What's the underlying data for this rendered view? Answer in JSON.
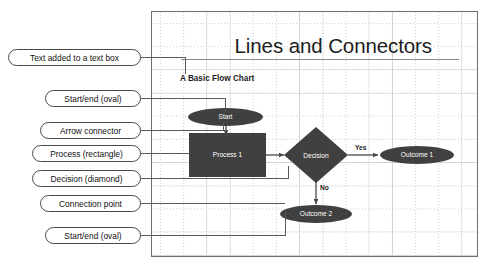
{
  "slide": {
    "title": "Lines and Connectors",
    "subtitle": "A Basic Flow Chart"
  },
  "flowchart": {
    "nodes": [
      {
        "id": "start",
        "label": "Start",
        "shape": "oval"
      },
      {
        "id": "process",
        "label": "Process 1",
        "shape": "rectangle"
      },
      {
        "id": "decision",
        "label": "Decision",
        "shape": "diamond"
      },
      {
        "id": "outcome1",
        "label": "Outcome 1",
        "shape": "oval"
      },
      {
        "id": "outcome2",
        "label": "Outcome 2",
        "shape": "oval"
      }
    ],
    "edge_labels": {
      "yes": "Yes",
      "no": "No"
    },
    "shape_fill": "#404040",
    "shape_text": "#ffffff"
  },
  "callouts": [
    {
      "id": "textbox",
      "label": "Text added to a text box"
    },
    {
      "id": "start-oval",
      "label": "Start/end (oval)"
    },
    {
      "id": "arrow",
      "label": "Arrow connector"
    },
    {
      "id": "process",
      "label": "Process (rectangle)"
    },
    {
      "id": "decision",
      "label": "Decision (diamond)"
    },
    {
      "id": "connection",
      "label": "Connection point"
    },
    {
      "id": "end-oval",
      "label": "Start/end (oval)"
    }
  ]
}
